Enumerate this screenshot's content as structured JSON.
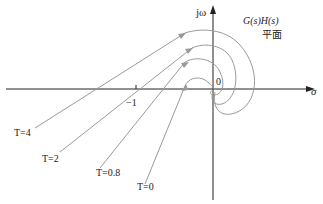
{
  "diagram": {
    "plane_label_line1": "G(s)H(s)",
    "plane_label_line2": "平面",
    "axes": {
      "y_label": "jω",
      "x_label": "σ",
      "origin_label": "0",
      "tick_label": "−1"
    },
    "curves": [
      {
        "label": "T=4"
      },
      {
        "label": "T=2"
      },
      {
        "label": "T=0.8"
      },
      {
        "label": "T=0"
      }
    ],
    "colors": {
      "axis": "#222222",
      "curve": "#9a9a9a"
    }
  }
}
